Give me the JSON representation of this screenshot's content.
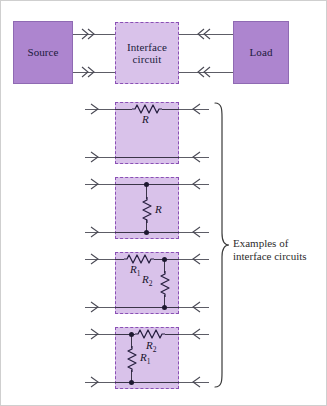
{
  "figure": {
    "kind": "block-and-circuit-diagram",
    "colors": {
      "solid_block_fill": "#ad85cf",
      "dashed_block_fill": "#d9c2ea",
      "dashed_block_border": "#8a4fb5",
      "wire": "#5d5d66",
      "text": "#201a3c",
      "frame_border": "#cfcfcf"
    }
  },
  "blocks": {
    "source": {
      "label": "Source"
    },
    "interface": {
      "label_line1": "Interface",
      "label_line2": "circuit"
    },
    "load": {
      "label": "Load"
    }
  },
  "arrows": {
    "source_out_top": "double-chevron-right-icon",
    "source_out_bottom": "double-chevron-right-icon",
    "load_in_top": "double-chevron-left-icon",
    "load_in_bottom": "double-chevron-left-icon"
  },
  "brace": {
    "icon": "right-curly-brace-icon",
    "caption_line1": "Examples of",
    "caption_line2": "interface circuits"
  },
  "examples": [
    {
      "id": "series-r",
      "topology": "series resistor",
      "components": [
        {
          "ref": "R",
          "label": "R",
          "placement": "series-top"
        }
      ],
      "port_arrows": {
        "left_top": "chevron-right-icon",
        "left_bottom": "chevron-right-icon",
        "right_top": "chevron-left-icon",
        "right_bottom": "chevron-left-icon"
      },
      "junction_dots": 0
    },
    {
      "id": "shunt-r",
      "topology": "shunt resistor",
      "components": [
        {
          "ref": "R",
          "label": "R",
          "placement": "shunt-middle"
        }
      ],
      "port_arrows": {
        "left_top": "chevron-right-icon",
        "left_bottom": "chevron-right-icon",
        "right_top": "chevron-left-icon",
        "right_bottom": "chevron-left-icon"
      },
      "junction_dots": 2
    },
    {
      "id": "l-network-series-first",
      "topology": "L network: series R1 then shunt R2",
      "components": [
        {
          "ref": "R1",
          "label": "R",
          "sub": "1",
          "placement": "series-top"
        },
        {
          "ref": "R2",
          "label": "R",
          "sub": "2",
          "placement": "shunt-right"
        }
      ],
      "port_arrows": {
        "left_top": "chevron-right-icon",
        "left_bottom": "chevron-right-icon",
        "right_top": "chevron-left-icon",
        "right_bottom": "chevron-left-icon"
      },
      "junction_dots": 2
    },
    {
      "id": "l-network-shunt-first",
      "topology": "L network: shunt R1 then series R2",
      "components": [
        {
          "ref": "R1",
          "label": "R",
          "sub": "1",
          "placement": "shunt-left"
        },
        {
          "ref": "R2",
          "label": "R",
          "sub": "2",
          "placement": "series-top"
        }
      ],
      "port_arrows": {
        "left_top": "chevron-right-icon",
        "left_bottom": "chevron-right-icon",
        "right_top": "chevron-left-icon",
        "right_bottom": "chevron-left-icon"
      },
      "junction_dots": 2
    }
  ]
}
